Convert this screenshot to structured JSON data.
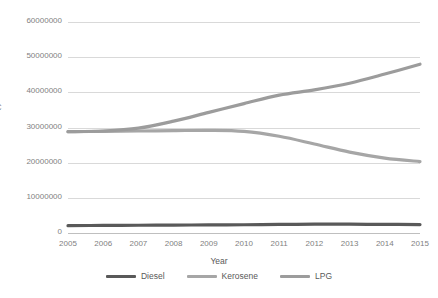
{
  "chart_data": {
    "type": "line",
    "title": "",
    "subtitle": "",
    "xlabel": "Year",
    "ylabel": "CO2 (t)",
    "x": [
      2005,
      2006,
      2007,
      2008,
      2009,
      2010,
      2011,
      2012,
      2013,
      2014,
      2015
    ],
    "categories": [
      "2005",
      "2006",
      "2007",
      "2008",
      "2009",
      "2010",
      "2011",
      "2012",
      "2013",
      "2014",
      "2015"
    ],
    "xtick_labels": [
      "2005",
      "2006",
      "2007",
      "2008",
      "2009",
      "2010",
      "2011",
      "2012",
      "2013",
      "2014",
      "2015"
    ],
    "ytick_labels": [
      "0",
      "10000000",
      "20000000",
      "30000000",
      "40000000",
      "50000000",
      "60000000"
    ],
    "ytick_values": [
      0,
      10000000,
      20000000,
      30000000,
      40000000,
      50000000,
      60000000
    ],
    "ylim": [
      0,
      60000000
    ],
    "xlim": [
      2005,
      2015
    ],
    "grid": "horizontal",
    "legend_position": "bottom",
    "series": [
      {
        "name": "Diesel",
        "color": "#595959",
        "values": [
          2100000,
          2150000,
          2200000,
          2250000,
          2300000,
          2350000,
          2450000,
          2500000,
          2500000,
          2450000,
          2400000
        ]
      },
      {
        "name": "Kerosene",
        "color": "#a6a6a6",
        "values": [
          28800000,
          28900000,
          29000000,
          29100000,
          29200000,
          28900000,
          27500000,
          25300000,
          23000000,
          21300000,
          20300000
        ]
      },
      {
        "name": "LPG",
        "color": "#9c9c9c",
        "values": [
          28800000,
          29000000,
          29800000,
          31800000,
          34300000,
          36800000,
          39200000,
          40700000,
          42600000,
          45200000,
          48000000
        ]
      }
    ]
  },
  "axes": {
    "y_title": "CO2 (t)",
    "x_title": "Year"
  },
  "legend": {
    "items": [
      {
        "label": "Diesel",
        "color": "#595959"
      },
      {
        "label": "Kerosene",
        "color": "#a6a6a6"
      },
      {
        "label": "LPG",
        "color": "#9c9c9c"
      }
    ]
  },
  "colors": {
    "background": "#ffffff",
    "gridline": "#d9d9d9",
    "axis_text": "#7f7f7f",
    "title_text": "#595959"
  }
}
